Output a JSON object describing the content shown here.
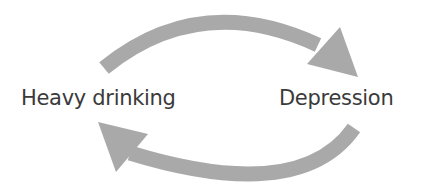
{
  "diagram": {
    "type": "cycle",
    "nodes": [
      {
        "id": "heavy_drinking",
        "label": "Heavy drinking"
      },
      {
        "id": "depression",
        "label": "Depression"
      }
    ],
    "edges": [
      {
        "from": "heavy_drinking",
        "to": "depression",
        "position": "top"
      },
      {
        "from": "depression",
        "to": "heavy_drinking",
        "position": "bottom"
      }
    ],
    "colors": {
      "arrow": "#a9a9a9",
      "text": "#3a3a3a",
      "background": "#ffffff"
    }
  }
}
